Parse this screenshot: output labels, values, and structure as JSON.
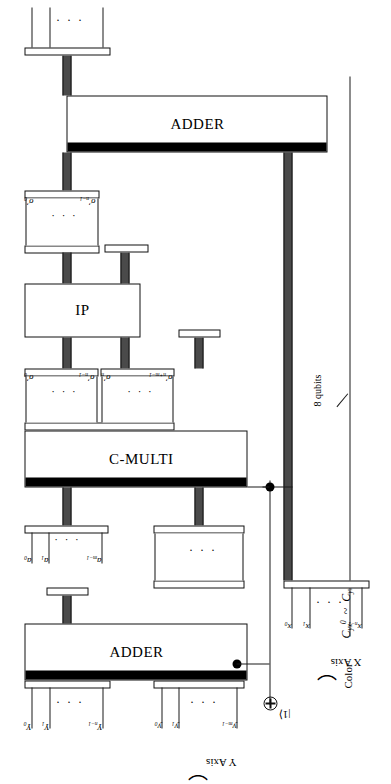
{
  "figure": {
    "type": "quantum-circuit-diagram",
    "orientation": "rotated-90-ccw",
    "title": ""
  },
  "blocks": [
    {
      "id": "adder-top",
      "label": "ADDER"
    },
    {
      "id": "ip",
      "label": "IP"
    },
    {
      "id": "c-multi",
      "label": "C-MULTI"
    },
    {
      "id": "adder-bot",
      "label": "ADDER"
    }
  ],
  "annotations": {
    "color_label": "Color",
    "color_range": "C yx 0 ~ C yx 7",
    "color_range_parts": {
      "base": "C",
      "sub": "yx",
      "sup_from": "0",
      "sup_to": "7",
      "tilde": "~"
    },
    "qubits_note": "8 qubits",
    "ket_one": "|1⟩",
    "x_axis_label": "X Axis",
    "y_axis_label": "Y Axis",
    "ellipsis": "· · ·"
  },
  "registers": {
    "x_prime_top": {
      "name": "x-prime",
      "first": "x′0",
      "second": "x′1",
      "last": "x′n−1",
      "items": [
        "x'0",
        "x'1",
        "x'n-1"
      ]
    },
    "sigma_prime_upper": {
      "name": "sigma-prime-upper",
      "first": "σ′0",
      "last": "σ′n−1",
      "items": [
        "σ'0",
        "σ'n-1"
      ]
    },
    "sigma_prime_lower_left": {
      "name": "sigma-prime-lower-left",
      "first": "σ′0",
      "last": "σ′n−1",
      "items": [
        "σ'0",
        "σ'n-1"
      ]
    },
    "sigma_prime_lower_right": {
      "name": "sigma-prime-lower-right",
      "first": "σ′n",
      "last": "σ′n+m−1",
      "items": [
        "σ'n",
        "σ'n+m-1"
      ]
    },
    "a_register": {
      "name": "a-register",
      "first": "a0",
      "second": "a1",
      "last": "am−1",
      "items": [
        "a0",
        "a1",
        "am-1"
      ]
    },
    "x_axis_bottom": {
      "name": "x-axis",
      "first": "x0",
      "second": "x1",
      "last": "xn−1",
      "items": [
        "x0",
        "x1",
        "xn-1"
      ]
    },
    "Y_middle": {
      "name": "Y-register",
      "first": "Y0",
      "second": "Y1",
      "last": "Yn−1",
      "items": [
        "Y0",
        "Y1",
        "Yn-1"
      ]
    },
    "y_axis_bottom": {
      "name": "y-axis",
      "first": "y0",
      "second": "y1",
      "last": "ym−1",
      "items": [
        "y0",
        "y1",
        "ym-1"
      ]
    }
  },
  "colors": {
    "stroke": "#111111",
    "bus_fill": "#4a4a4a",
    "bar_fill": "#000000",
    "background": "#ffffff"
  }
}
